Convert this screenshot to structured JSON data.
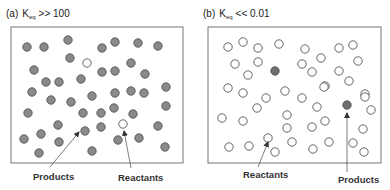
{
  "panels": [
    {
      "id": "a",
      "prefix": "(a)",
      "k_symbol": "K",
      "k_subscript": "eq",
      "condition": ">> 100",
      "box": {
        "x": 11,
        "y": 27,
        "w": 172,
        "h": 136
      },
      "labels": [
        {
          "text": "Products",
          "x": 33,
          "y": 180,
          "arrow": {
            "x1": 50,
            "y1": 167,
            "x2": 79,
            "y2": 132
          }
        },
        {
          "text": "Reactants",
          "x": 118,
          "y": 181,
          "arrow": {
            "x1": 131,
            "y1": 168,
            "x2": 124,
            "y2": 131
          }
        }
      ],
      "product_color": "#8a8a8a",
      "reactant_color": "#ffffff",
      "products": [
        [
          27,
          47
        ],
        [
          44,
          47
        ],
        [
          68,
          40
        ],
        [
          70,
          58
        ],
        [
          34,
          70
        ],
        [
          46,
          82
        ],
        [
          59,
          82
        ],
        [
          81,
          79
        ],
        [
          32,
          92
        ],
        [
          102,
          48
        ],
        [
          115,
          42
        ],
        [
          138,
          43
        ],
        [
          158,
          46
        ],
        [
          102,
          72
        ],
        [
          115,
          71
        ],
        [
          131,
          63
        ],
        [
          145,
          74
        ],
        [
          166,
          87
        ],
        [
          131,
          91
        ],
        [
          144,
          93
        ],
        [
          115,
          93
        ],
        [
          51,
          100
        ],
        [
          71,
          102
        ],
        [
          92,
          96
        ],
        [
          28,
          113
        ],
        [
          83,
          113
        ],
        [
          58,
          125
        ],
        [
          41,
          134
        ],
        [
          24,
          139
        ],
        [
          59,
          142
        ],
        [
          85,
          131
        ],
        [
          39,
          153
        ],
        [
          92,
          151
        ],
        [
          101,
          113
        ],
        [
          114,
          108
        ],
        [
          133,
          114
        ],
        [
          166,
          106
        ],
        [
          101,
          127
        ],
        [
          158,
          126
        ],
        [
          118,
          140
        ],
        [
          139,
          138
        ],
        [
          165,
          147
        ]
      ],
      "reactants": [
        [
          87,
          63
        ],
        [
          123,
          124
        ]
      ]
    },
    {
      "id": "b",
      "prefix": "(b)",
      "k_symbol": "K",
      "k_subscript": "eq",
      "condition": "<< 0.01",
      "box": {
        "x": 208,
        "y": 27,
        "w": 173,
        "h": 136
      },
      "labels": [
        {
          "text": "Reactants",
          "x": 243,
          "y": 178,
          "arrow": {
            "x1": 258,
            "y1": 167,
            "x2": 268,
            "y2": 142
          }
        },
        {
          "text": "Products",
          "x": 338,
          "y": 183,
          "arrow": {
            "x1": 347,
            "y1": 172,
            "x2": 347,
            "y2": 113
          }
        }
      ],
      "product_color": "#6e6e6e",
      "reactant_color": "#ffffff",
      "products": [
        [
          275,
          71
        ],
        [
          347,
          105
        ]
      ],
      "reactants": [
        [
          228,
          47
        ],
        [
          243,
          42
        ],
        [
          258,
          48
        ],
        [
          279,
          44
        ],
        [
          235,
          64
        ],
        [
          258,
          62
        ],
        [
          248,
          75
        ],
        [
          228,
          88
        ],
        [
          243,
          93
        ],
        [
          285,
          91
        ],
        [
          305,
          49
        ],
        [
          339,
          48
        ],
        [
          353,
          45
        ],
        [
          321,
          58
        ],
        [
          302,
          64
        ],
        [
          312,
          72
        ],
        [
          358,
          61
        ],
        [
          339,
          71
        ],
        [
          349,
          81
        ],
        [
          325,
          86
        ],
        [
          365,
          94
        ],
        [
          266,
          98
        ],
        [
          257,
          108
        ],
        [
          222,
          118
        ],
        [
          243,
          121
        ],
        [
          287,
          115
        ],
        [
          287,
          128
        ],
        [
          268,
          138
        ],
        [
          292,
          142
        ],
        [
          229,
          147
        ],
        [
          249,
          146
        ],
        [
          275,
          152
        ],
        [
          324,
          87
        ],
        [
          302,
          98
        ],
        [
          317,
          107
        ],
        [
          365,
          97
        ],
        [
          371,
          110
        ],
        [
          325,
          121
        ],
        [
          312,
          127
        ],
        [
          363,
          129
        ],
        [
          329,
          142
        ],
        [
          353,
          143
        ],
        [
          313,
          149
        ],
        [
          364,
          152
        ]
      ]
    }
  ]
}
